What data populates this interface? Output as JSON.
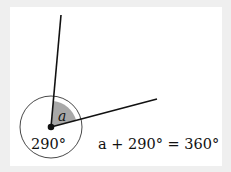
{
  "diagram": {
    "vertex": {
      "x": 51,
      "y": 127
    },
    "ray_up_end": {
      "x": 61,
      "y": 15
    },
    "ray_right_end": {
      "x": 157,
      "y": 99
    },
    "circle_radius": 31,
    "wedge_radius": 26,
    "labels": {
      "angle_a": "a",
      "reflex_angle": "290°",
      "equation": "a + 290° = 360°"
    },
    "colors": {
      "background": "#efefef",
      "panel": "#ffffff",
      "stroke": "#111111",
      "wedge_fill": "#a8a8a8"
    }
  }
}
